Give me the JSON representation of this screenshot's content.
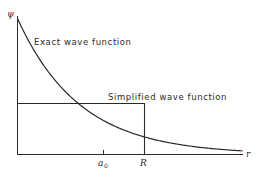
{
  "figure": {
    "y_axis_label": "ψ",
    "x_axis_label": "r",
    "curve_label": "Exact wave function",
    "step_label": "Simplified wave function",
    "tick_a0_main": "a",
    "tick_a0_sub": "0",
    "tick_R": "R",
    "colors": {
      "line": "#2a2a2a",
      "background": "#ffffff"
    }
  },
  "chart_data": {
    "type": "line",
    "title": "",
    "xlabel": "r",
    "ylabel": "ψ",
    "x_ticks": [
      "a0",
      "R"
    ],
    "series": [
      {
        "name": "Exact wave function",
        "form": "exponential decay ψ = ψ0·exp(-r/a0)",
        "points": [
          [
            0,
            1.0
          ],
          [
            0.5,
            0.61
          ],
          [
            1.0,
            0.37
          ],
          [
            1.48,
            0.12
          ],
          [
            2.0,
            0.05
          ],
          [
            2.6,
            0.0
          ]
        ]
      },
      {
        "name": "Simplified wave function",
        "form": "step: constant for r < R, zero for r > R",
        "points": [
          [
            0,
            0.37
          ],
          [
            1.48,
            0.37
          ],
          [
            1.48,
            0.0
          ],
          [
            2.6,
            0.0
          ]
        ]
      }
    ],
    "annotations": {
      "a0_position": 1.0,
      "R_position": 1.48
    },
    "grid": false
  }
}
